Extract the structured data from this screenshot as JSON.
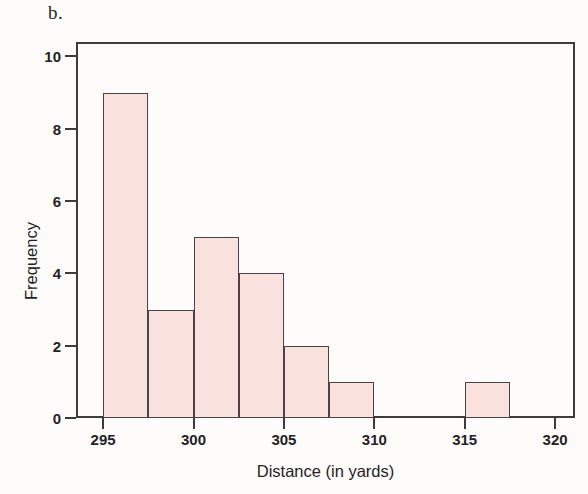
{
  "panel_letter": "b.",
  "colors": {
    "bar_fill": "#f9e2dd",
    "bar_stroke": "#4a4244",
    "axis": "#3e3a3c",
    "text": "#262224",
    "background": "#fdfcfa"
  },
  "chart_data": {
    "type": "bar",
    "title": "b.",
    "xlabel": "Distance (in yards)",
    "ylabel": "Frequency",
    "xlim": [
      293.5,
      321.1
    ],
    "ylim": [
      0,
      10.4
    ],
    "xticks": [
      295,
      300,
      305,
      310,
      315,
      320
    ],
    "xtick_labels": [
      "295",
      "300",
      "305",
      "310",
      "315",
      "320"
    ],
    "yticks": [
      0,
      2,
      4,
      6,
      8,
      10
    ],
    "ytick_labels": [
      "0",
      "2",
      "4",
      "6",
      "8",
      "10"
    ],
    "grid": false,
    "legend": false,
    "bin_width": 2.5,
    "bins": [
      {
        "start": 295.0,
        "end": 297.5,
        "frequency": 9
      },
      {
        "start": 297.5,
        "end": 300.0,
        "frequency": 3
      },
      {
        "start": 300.0,
        "end": 302.5,
        "frequency": 5
      },
      {
        "start": 302.5,
        "end": 305.0,
        "frequency": 4
      },
      {
        "start": 305.0,
        "end": 307.5,
        "frequency": 2
      },
      {
        "start": 307.5,
        "end": 310.0,
        "frequency": 1
      },
      {
        "start": 310.0,
        "end": 312.5,
        "frequency": 0
      },
      {
        "start": 312.5,
        "end": 315.0,
        "frequency": 0
      },
      {
        "start": 315.0,
        "end": 317.5,
        "frequency": 1
      }
    ],
    "categories": [
      "295-297.5",
      "297.5-300",
      "300-302.5",
      "302.5-305",
      "305-307.5",
      "307.5-310",
      "310-312.5",
      "312.5-315",
      "315-317.5"
    ],
    "values": [
      9,
      3,
      5,
      4,
      2,
      1,
      0,
      0,
      1
    ]
  }
}
